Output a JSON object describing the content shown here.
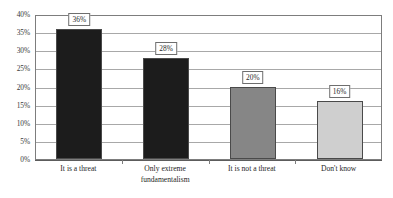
{
  "chart_data": {
    "type": "bar",
    "title": "",
    "subtitle": "",
    "xlabel": "",
    "ylabel": "",
    "categories": [
      "It is a threat",
      "Only extreme\nfundamentalism",
      "It is not a threat",
      "Don't know"
    ],
    "values": [
      36,
      28,
      20,
      16
    ],
    "data_labels": [
      "36%",
      "28%",
      "20%",
      "16%"
    ],
    "bar_colors": [
      "#1c1c1c",
      "#1c1c1c",
      "#868686",
      "#cfcfcf"
    ],
    "ylim": [
      0,
      40
    ],
    "ytick_values": [
      0,
      5,
      10,
      15,
      20,
      25,
      30,
      35,
      40
    ],
    "ytick_labels": [
      "0%",
      "5%",
      "10%",
      "15%",
      "20%",
      "25%",
      "30%",
      "35%",
      "40%"
    ],
    "grid": true,
    "legend": "none",
    "value_suffix": "%"
  },
  "style": {
    "plot_border_color": "#7d7d7d",
    "gridline_color": "#a8a8a8",
    "axis_color": "#5c5c5c",
    "label_box_border": "#6e6e6e",
    "background": "#ffffff"
  }
}
